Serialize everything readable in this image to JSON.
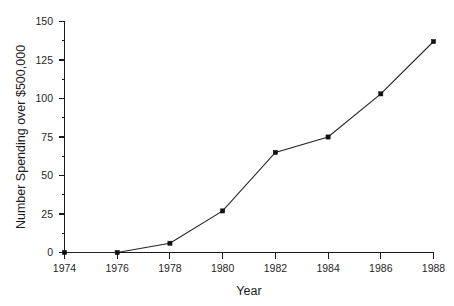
{
  "chart_data": {
    "type": "line",
    "title": "",
    "subtitle": "",
    "xlabel": "Year",
    "ylabel": "Number Spending over $500,000",
    "x": [
      1974,
      1976,
      1978,
      1980,
      1982,
      1984,
      1986,
      1988
    ],
    "values": [
      0,
      0,
      6,
      27,
      65,
      75,
      103,
      137
    ],
    "series": [
      {
        "name": "Number Spending over $500,000",
        "values": [
          0,
          0,
          6,
          27,
          65,
          75,
          103,
          137
        ]
      }
    ],
    "xtick_labels": [
      "1974",
      "1976",
      "1978",
      "1980",
      "1982",
      "1984",
      "1986",
      "1988"
    ],
    "ytick_labels": [
      "0",
      "25",
      "50",
      "75",
      "100",
      "125",
      "150"
    ],
    "xticks": [
      1974,
      1976,
      1978,
      1980,
      1982,
      1984,
      1986,
      1988
    ],
    "yticks": [
      0,
      25,
      50,
      75,
      100,
      125,
      150
    ],
    "xlim": [
      1974,
      1988
    ],
    "ylim": [
      0,
      150
    ],
    "grid": false,
    "legend": false,
    "legend_position": "none",
    "marker": "square",
    "line_color": "#262626",
    "marker_color": "#111111",
    "background_color": "#ffffff",
    "annotations": []
  }
}
